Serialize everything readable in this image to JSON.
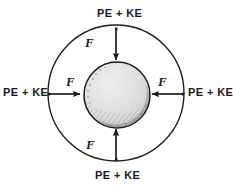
{
  "figure": {
    "colors": {
      "ink": "#1a1a1a",
      "sphere_fill": "#dedede",
      "sphere_shadow": "#a8a8a8",
      "background": "#ffffff"
    },
    "outer_circle": {
      "name": "outer-orbit-circle",
      "cx": 116,
      "cy": 93,
      "r": 68,
      "stroke": "#1a1a1a",
      "stroke_width": 1.3,
      "fill": "none"
    },
    "inner_sphere": {
      "name": "central-sphere",
      "cx": 117,
      "cy": 95,
      "r": 33,
      "stroke": "#1a1a1a",
      "stroke_width": 1.4,
      "fill": "#dedede"
    },
    "energy_labels": [
      {
        "id": "label-top",
        "text": "PE + KE",
        "position": "top"
      },
      {
        "id": "label-right",
        "text": "PE + KE",
        "position": "right"
      },
      {
        "id": "label-bottom",
        "text": "PE + KE",
        "position": "bottom"
      },
      {
        "id": "label-left",
        "text": "PE + KE",
        "position": "left"
      }
    ],
    "force_labels": [
      {
        "id": "force-top",
        "text": "F",
        "position": "top"
      },
      {
        "id": "force-right",
        "text": "F",
        "position": "right"
      },
      {
        "id": "force-bottom",
        "text": "F",
        "position": "bottom"
      },
      {
        "id": "force-left",
        "text": "F",
        "position": "left"
      }
    ],
    "arrows": [
      {
        "id": "arrow-top",
        "direction": "down",
        "from": [
          116,
          29
        ],
        "to": [
          116,
          60
        ]
      },
      {
        "id": "arrow-right",
        "direction": "left",
        "from": [
          183,
          94
        ],
        "to": [
          152,
          94
        ]
      },
      {
        "id": "arrow-bottom",
        "direction": "up",
        "from": [
          116,
          159
        ],
        "to": [
          116,
          129
        ]
      },
      {
        "id": "arrow-left",
        "direction": "right",
        "from": [
          49,
          94
        ],
        "to": [
          80,
          94
        ]
      }
    ]
  }
}
